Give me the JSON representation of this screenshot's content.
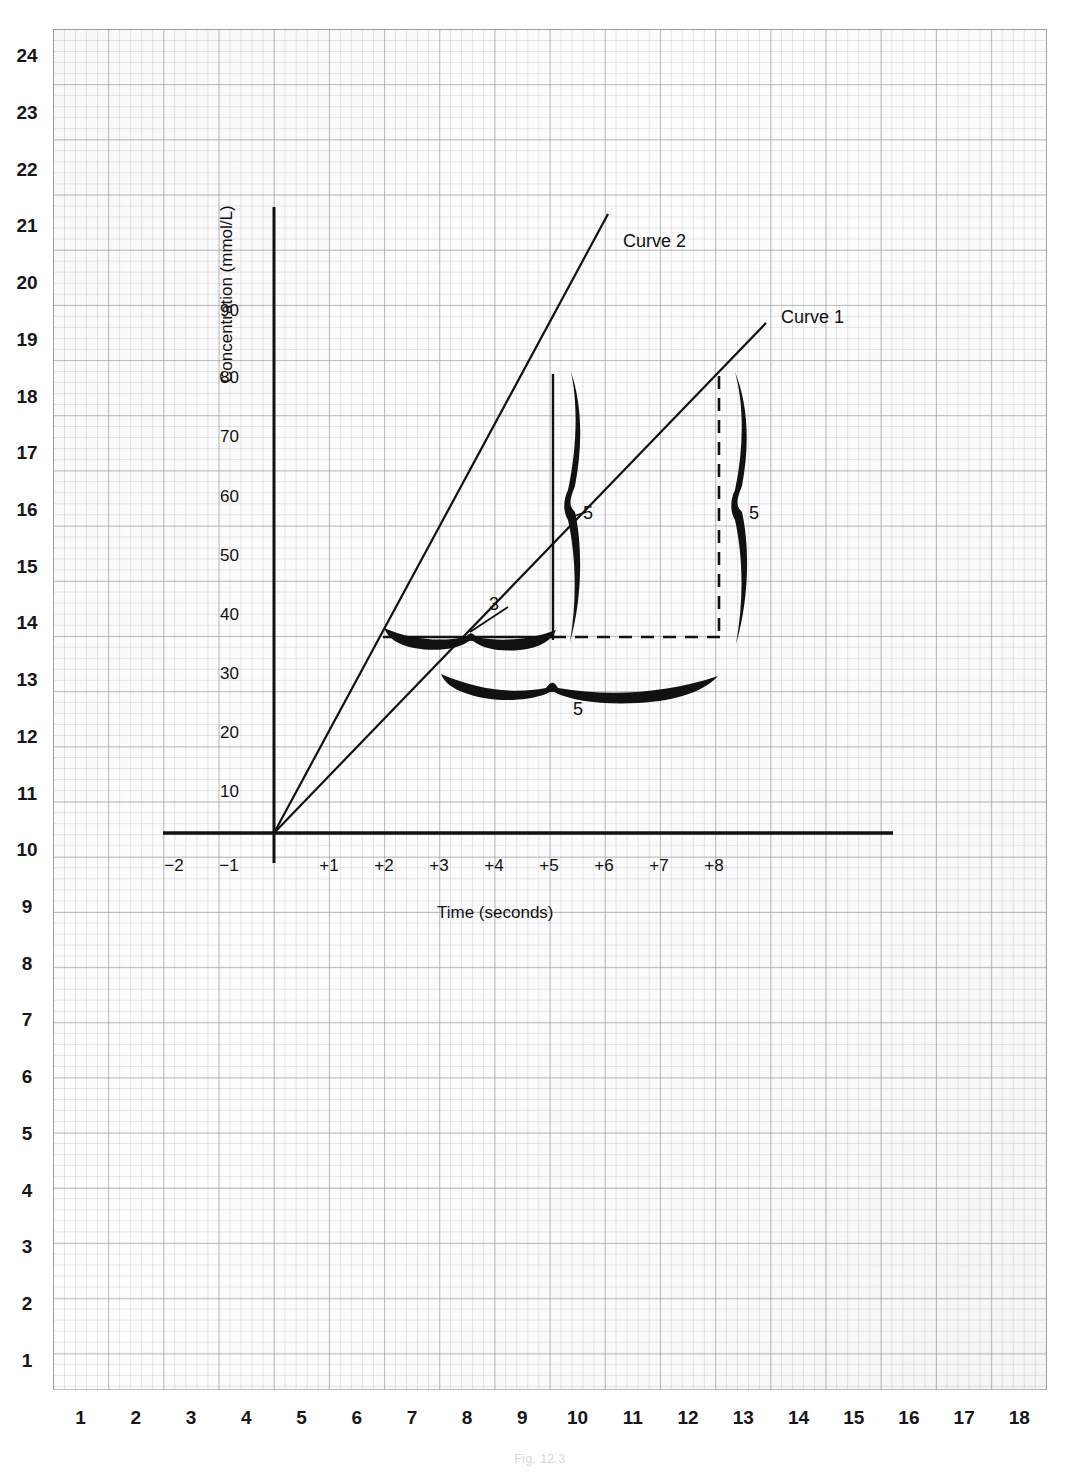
{
  "figure": {
    "caption": "Fig. 12.3",
    "background": "#ffffff",
    "ink_color": "#111111",
    "grid_color": "#96969e"
  },
  "margin_rulers": {
    "left_label": "row-ruler",
    "bottom_label": "column-ruler",
    "left_values": [
      24,
      23,
      22,
      21,
      20,
      19,
      18,
      17,
      16,
      15,
      14,
      13,
      12,
      11,
      10,
      9,
      8,
      7,
      6,
      5,
      4,
      3,
      2,
      1
    ],
    "bottom_values": [
      1,
      2,
      3,
      4,
      5,
      6,
      7,
      8,
      9,
      10,
      11,
      12,
      13,
      14,
      15,
      16,
      17,
      18
    ]
  },
  "chart_data": {
    "type": "line",
    "title": "",
    "xlabel": "Time (seconds)",
    "ylabel": "Concentration (mmol/L)",
    "xlim": [
      -2.6,
      9.5
    ],
    "ylim": [
      -5,
      100
    ],
    "xticks": [
      "−2",
      "−1",
      "+1",
      "+2",
      "+3",
      "+4",
      "+5",
      "+6",
      "+7",
      "+8"
    ],
    "xtick_values": [
      -2,
      -1,
      1,
      2,
      3,
      4,
      5,
      6,
      7,
      8
    ],
    "yticks": [
      "10",
      "20",
      "30",
      "40",
      "50",
      "60",
      "70",
      "80",
      "90"
    ],
    "ytick_values": [
      10,
      20,
      30,
      40,
      50,
      60,
      70,
      80,
      90
    ],
    "grid": true,
    "legend": "inline-labels",
    "series": [
      {
        "name": "Curve 2",
        "label": "Curve 2",
        "points": [
          [
            0,
            0
          ],
          [
            2,
            30
          ],
          [
            5,
            80
          ],
          [
            6.9,
            110
          ]
        ],
        "slope_mmol_per_s": 15,
        "style": "solid"
      },
      {
        "name": "Curve 1",
        "label": "Curve 1",
        "points": [
          [
            0,
            0
          ],
          [
            3.2,
            30
          ],
          [
            8,
            80
          ],
          [
            8.9,
            89
          ]
        ],
        "slope_mmol_per_s": 10,
        "style": "solid"
      }
    ],
    "annotations": [
      {
        "name": "reference-line-30",
        "kind": "solid-horizontal",
        "y": 30,
        "x_from": 2,
        "x_to": 5
      },
      {
        "name": "dashed-line-30",
        "kind": "dashed-horizontal",
        "y": 30,
        "x_from": 5,
        "x_to": 8
      },
      {
        "name": "drop-line-curve2",
        "kind": "solid-vertical",
        "x": 5,
        "y_from": 30,
        "y_to": 80
      },
      {
        "name": "drop-line-curve1",
        "kind": "dashed-vertical",
        "x": 8,
        "y_from": 30,
        "y_to": 80
      },
      {
        "name": "brace-top-horizontal",
        "kind": "brace-horizontal",
        "value": "3",
        "span_from": 2,
        "span_to": 5,
        "at_y": 31
      },
      {
        "name": "brace-bottom-horizontal",
        "kind": "brace-horizontal",
        "value": "5",
        "span_from": 3.2,
        "span_to": 8,
        "at_y": 28
      },
      {
        "name": "brace-left-vertical",
        "kind": "brace-vertical",
        "value": "5",
        "span_from": 30,
        "span_to": 80,
        "at_x": 5.2
      },
      {
        "name": "brace-right-vertical",
        "kind": "brace-vertical",
        "value": "5",
        "span_from": 30,
        "span_to": 80,
        "at_x": 8.2
      }
    ]
  },
  "labels": {
    "curve2": "Curve 2",
    "curve1": "Curve 1",
    "brace_top": "3",
    "brace_bottom": "5",
    "brace_left": "5",
    "brace_right": "5"
  }
}
